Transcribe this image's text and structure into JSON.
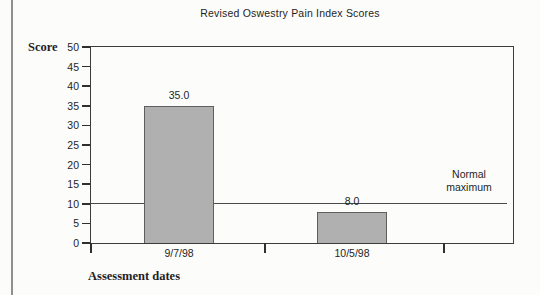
{
  "chart_data": {
    "type": "bar",
    "title": "Revised Oswestry Pain Index Scores",
    "ylabel": "Score",
    "xlabel": "Assessment dates",
    "categories": [
      "9/7/98",
      "10/5/98"
    ],
    "values": [
      35.0,
      8.0
    ],
    "bar_value_labels": [
      "35.0",
      "8.0"
    ],
    "ylim": [
      0,
      50
    ],
    "ytick_step": 5,
    "yticks": [
      0,
      5,
      10,
      15,
      20,
      25,
      30,
      35,
      40,
      45,
      50
    ],
    "grid": false,
    "legend": "none",
    "reference_line": {
      "value": 10,
      "label": "Normal\nmaximum"
    },
    "colors": {
      "bar_fill": "#b0b0b0",
      "bar_border": "#5e5e5e",
      "plot_border": "#3c3c3c",
      "reference_line": "#4a4a4a",
      "text": "#1f1f1f",
      "page_edge_line": "#8f8f8f",
      "background": "#fcfcfa"
    }
  }
}
